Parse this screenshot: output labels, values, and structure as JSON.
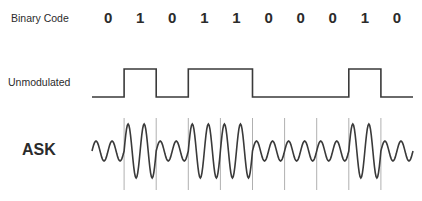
{
  "labels": {
    "binary_code": "Binary Code",
    "unmodulated": "Unmodulated",
    "ask": "ASK"
  },
  "bits": [
    "0",
    "1",
    "0",
    "1",
    "1",
    "0",
    "0",
    "0",
    "1",
    "0"
  ],
  "colors": {
    "text": "#2b2b2b",
    "signal": "#3a3a3a",
    "divider": "#b0b0b0",
    "background": "#ffffff"
  },
  "geometry": {
    "start_x": 92,
    "bit_width": 32.1,
    "unmodulated_high_y": 69,
    "unmodulated_low_y": 97,
    "ask_center_y": 151,
    "ask_high_amplitude": 27,
    "ask_low_amplitude": 10,
    "cycles_per_bit": 2,
    "divider_top_y": 118,
    "divider_bottom_y": 190
  }
}
